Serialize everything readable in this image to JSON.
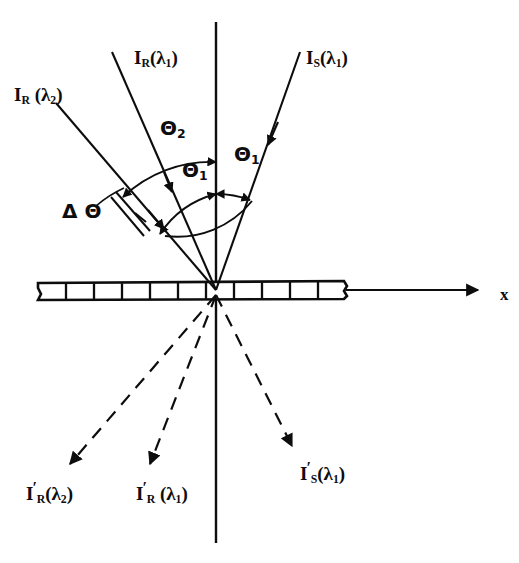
{
  "figure": {
    "domain": "diagram",
    "kind": "optics-diffraction-grating-schematic",
    "background_color": "#ffffff",
    "ink_color": "#0d0d0d"
  },
  "axes": {
    "x_axis": {
      "label": "x",
      "label_x": 500,
      "label_y": 286,
      "line": {
        "x1": 36,
        "y1": 290,
        "x2": 478,
        "y2": 290
      },
      "arrow_head": true
    },
    "normal_axis": {
      "label": "",
      "line": {
        "x1": 216,
        "y1": 22,
        "x2": 216,
        "y2": 543
      },
      "arrow_head": false
    },
    "origin": {
      "x": 216,
      "y": 290
    }
  },
  "grating": {
    "name": "grating-plate",
    "left": 38,
    "right": 346,
    "top": 281,
    "bottom": 299,
    "segment_count": 11,
    "segment_divider_xs": [
      66,
      94,
      122,
      150,
      178,
      206,
      234,
      262,
      290,
      318
    ],
    "break_at_right": true
  },
  "incident_rays": [
    {
      "id": "ray-IR-lambda2",
      "label_html": "I<sub>R</sub> (λ<sub>2</sub>)",
      "label_plain": "I_R (λ2)",
      "label_x": 14,
      "label_y": 85,
      "from": {
        "x": 56,
        "y": 103
      },
      "to": {
        "x": 216,
        "y": 290
      },
      "style": "solid",
      "arrow_at": {
        "x": 160,
        "y": 224
      },
      "arrow_direction": "toward-origin"
    },
    {
      "id": "ray-IR-lambda1",
      "label_html": "I<sub>R</sub>(λ<sub>1</sub>)",
      "label_plain": "I_R(λ1)",
      "label_x": 134,
      "label_y": 48,
      "from": {
        "x": 112,
        "y": 52
      },
      "to": {
        "x": 216,
        "y": 290
      },
      "style": "solid",
      "arrow_at": {
        "x": 172,
        "y": 191
      },
      "arrow_direction": "toward-origin"
    },
    {
      "id": "ray-IS-lambda1",
      "label_html": "I<sub>S</sub>(λ<sub>1</sub>)",
      "label_plain": "I_S(λ1)",
      "label_x": 306,
      "label_y": 48,
      "from": {
        "x": 300,
        "y": 52
      },
      "to": {
        "x": 216,
        "y": 290
      },
      "style": "solid",
      "arrow_at": {
        "x": 268,
        "y": 142
      },
      "arrow_direction": "toward-origin"
    }
  ],
  "diffracted_rays": [
    {
      "id": "ray-IR-prime-lambda2",
      "label_html": "I<span class=\"prime\">′</span><sub>R</sub>(λ<sub>2</sub>)",
      "label_plain": "I'_R(λ2)",
      "label_x": 26,
      "label_y": 480,
      "from": {
        "x": 216,
        "y": 290
      },
      "to": {
        "x": 64,
        "y": 468
      },
      "style": "dashed",
      "arrow_head": true
    },
    {
      "id": "ray-IR-prime-lambda1",
      "label_html": "I<span class=\"prime\">′</span><sub>R</sub> (λ<sub>1</sub>)",
      "label_plain": "I'_R (λ1)",
      "label_x": 136,
      "label_y": 480,
      "from": {
        "x": 216,
        "y": 290
      },
      "to": {
        "x": 146,
        "y": 468
      },
      "style": "dashed",
      "arrow_head": true
    },
    {
      "id": "ray-IS-prime-lambda1",
      "label_html": "I<span class=\"prime\">′</span><sub>S</sub>(λ<sub>1</sub>)",
      "label_plain": "I'_S(λ1)",
      "label_x": 300,
      "label_y": 460,
      "from": {
        "x": 216,
        "y": 290
      },
      "to": {
        "x": 296,
        "y": 449
      },
      "style": "dashed",
      "arrow_head": true
    }
  ],
  "angle_annotations": [
    {
      "id": "angle-theta2",
      "label_html": "Θ<sub>2</sub>",
      "label_plain": "Θ2",
      "label_x": 160,
      "label_y": 118,
      "arc_radius": 128,
      "arc_from_deg": 115,
      "arc_to_deg": 90,
      "double_arrow": true
    },
    {
      "id": "angle-theta1-left",
      "label_html": "Θ<sub>1</sub>",
      "label_plain": "Θ1",
      "label_x": 182,
      "label_y": 160,
      "arc_radius": 96,
      "arc_from_deg": 103,
      "arc_to_deg": 90,
      "double_arrow": true
    },
    {
      "id": "angle-theta1-right",
      "label_html": "Θ<sub>1</sub>",
      "label_plain": "Θ1",
      "label_x": 234,
      "label_y": 144,
      "arc_radius": 96,
      "arc_from_deg": 90,
      "arc_to_deg": 70,
      "double_arrow": true
    },
    {
      "id": "angle-delta-theta",
      "label_html": "Δ Θ",
      "label_plain": "ΔΘ",
      "label_x": 62,
      "label_y": 201,
      "marker": "double-tick-between-left-rays"
    }
  ]
}
